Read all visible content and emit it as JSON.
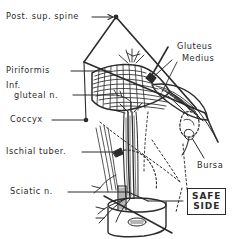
{
  "figure": {
    "background_color": "#ffffff",
    "ink_color": "#2b2b2b",
    "width": 238,
    "height": 239
  },
  "labels": {
    "post_sup_spine": "Post. sup. spine",
    "gluteus_medius_line1": "Gluteus",
    "gluteus_medius_line2": "Medius",
    "piriformis": "Piriformis",
    "inf_line1": "Inf.",
    "inf_line2": "gluteal n.",
    "coccyx": "Coccyx",
    "ischial_tuber": "Ischial tuber.",
    "sciatic_n": "Sciatic n.",
    "bursa": "Bursa",
    "safe_side_line1": "SAFE",
    "safe_side_line2": "SIDE"
  }
}
